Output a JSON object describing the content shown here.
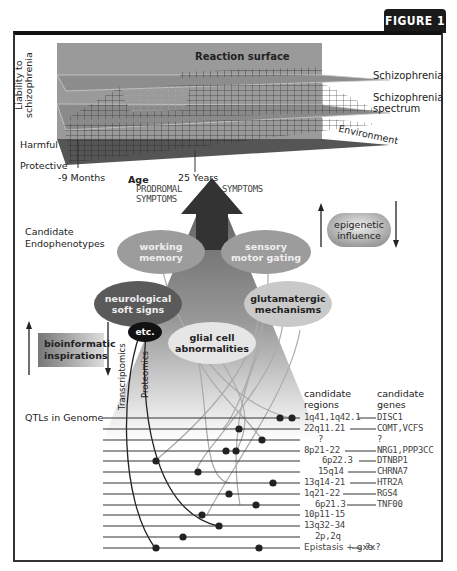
{
  "figure_label": "FIGURE 1",
  "top_panel": {
    "title": "Reaction surface",
    "y_axis_label_line1": "Liability to",
    "y_axis_label_line2": "schizophrenia",
    "level_harmful": "Harmful",
    "level_protective": "Protective",
    "right_label_schizophrenia": "Schizophrenia",
    "right_label_spectrum_line1": "Schizophrenia",
    "right_label_spectrum_line2": "spectrum",
    "environment_label": "Environment",
    "age_start": "-9 Months",
    "age_label": "Age",
    "age_end": "25 Years"
  },
  "symptoms": {
    "prodromal_line1": "PRODROMAL",
    "prodromal_line2": "SYMPTOMS",
    "symptoms": "SYMPTOMS"
  },
  "epigenetic": {
    "line1": "epigenetic",
    "line2": "influence"
  },
  "endophenotypes": {
    "heading_line1": "Candidate",
    "heading_line2": "Endophenotypes",
    "items": [
      {
        "line1": "working",
        "line2": "memory"
      },
      {
        "line1": "sensory",
        "line2": "motor gating"
      },
      {
        "line1": "neurological",
        "line2": "soft signs"
      },
      {
        "line1": "glutamatergic",
        "line2": "mechanisms"
      },
      {
        "line1": "glial cell",
        "line2": "abnormalities"
      },
      {
        "line1": "etc.",
        "line2": ""
      }
    ]
  },
  "bioinformatic": {
    "line1": "bioinformatic",
    "line2": "inspirations"
  },
  "omics": {
    "transcriptomics": "Transcriptomics",
    "proteomics": "Proteomics"
  },
  "qtl": {
    "heading": "QTLs in Genome",
    "regions_heading_line1": "candidate",
    "regions_heading_line2": "regions",
    "genes_heading_line1": "candidate",
    "genes_heading_line2": "genes",
    "rows": [
      {
        "region": "1q41,1q42.1",
        "gene": "DISC1"
      },
      {
        "region": "22q11.21",
        "gene": "COMT,VCFS"
      },
      {
        "region": "?",
        "gene": "?"
      },
      {
        "region": "8p21-22",
        "gene": "NRG1,PPP3CC"
      },
      {
        "region": "6p22.3",
        "gene": "DTNBP1"
      },
      {
        "region": "15q14",
        "gene": "CHRNA7"
      },
      {
        "region": "13q14-21",
        "gene": "HTR2A"
      },
      {
        "region": "1q21-22",
        "gene": "RGS4"
      },
      {
        "region": "6p21.3",
        "gene": "TNF00"
      },
      {
        "region": "10p11-15",
        "gene": ""
      },
      {
        "region": "13q32-34",
        "gene": ""
      },
      {
        "region": "2p,2q",
        "gene": ""
      },
      {
        "region": "Epistasis + gxe",
        "gene": "?x?"
      }
    ]
  }
}
